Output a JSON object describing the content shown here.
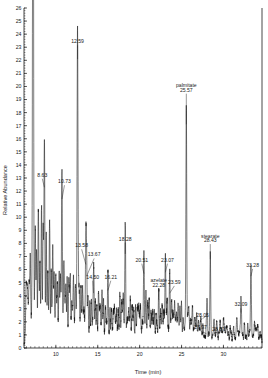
{
  "chart_data": {
    "type": "line",
    "title": "",
    "xlabel": "Time (min)",
    "ylabel": "Relative Abundance",
    "xlim": [
      6.2,
      34.6
    ],
    "ylim": [
      0,
      26
    ],
    "grid": false,
    "legend": "none",
    "x_ticks_major": [
      10,
      15,
      20,
      25,
      30
    ],
    "x_tick_labels": [
      "10",
      "15",
      "20",
      "25",
      "30"
    ],
    "x_minor_step": 0.5,
    "y_ticks_major": [
      0,
      1,
      2,
      3,
      4,
      5,
      6,
      7,
      8,
      9,
      10,
      11,
      12,
      13,
      14,
      15,
      16,
      17,
      18,
      19,
      20,
      21,
      22,
      23,
      24,
      25,
      26
    ],
    "y_tick_labels": [
      "0",
      "1",
      "2",
      "3",
      "4",
      "5",
      "6",
      "7",
      "8",
      "9",
      "10",
      "11",
      "12",
      "13",
      "14",
      "15",
      "16",
      "17",
      "18",
      "19",
      "20",
      "21",
      "22",
      "23",
      "24",
      "25",
      "26"
    ],
    "y_minor_step": 0.2,
    "trace_color": "#111111",
    "annotations": [
      {
        "rt": 8.63,
        "label": "8.63",
        "name": "",
        "height": 12.2,
        "label_y": 13.1,
        "label_x_shift": -0.25
      },
      {
        "rt": 10.73,
        "label": "10.73",
        "name": "",
        "height": 11.3,
        "label_y": 12.6,
        "label_x_shift": 0.3
      },
      {
        "rt": 12.59,
        "label": "12.59",
        "name": "",
        "height": 22.0,
        "label_y": 23.3,
        "label_x_shift": 0.0
      },
      {
        "rt": 13.58,
        "label": "13.58",
        "name": "",
        "height": 6.3,
        "label_y": 7.7,
        "label_x_shift": -0.5
      },
      {
        "rt": 13.67,
        "label": "13.67",
        "name": "",
        "height": 5.4,
        "label_y": 7.0,
        "label_x_shift": 0.9
      },
      {
        "rt": 14.5,
        "label": "14.50",
        "name": "",
        "height": 4.1,
        "label_y": 5.3,
        "label_x_shift": -0.1
      },
      {
        "rt": 16.21,
        "label": "16.21",
        "name": "",
        "height": 4.3,
        "label_y": 5.3,
        "label_x_shift": 0.35
      },
      {
        "rt": 18.28,
        "label": "18.28",
        "name": "",
        "height": 7.1,
        "label_y": 8.2,
        "label_x_shift": 0.0
      },
      {
        "rt": 20.51,
        "label": "20.51",
        "name": "",
        "height": 5.6,
        "label_y": 6.6,
        "label_x_shift": -0.25
      },
      {
        "rt": 22.28,
        "label": "22.28",
        "name": "azelate",
        "height": 3.6,
        "label_y": 4.7,
        "label_x_shift": 0.0
      },
      {
        "rt": 23.07,
        "label": "23.07",
        "name": "",
        "height": 5.7,
        "label_y": 6.6,
        "label_x_shift": 0.25
      },
      {
        "rt": 23.59,
        "label": "23.59",
        "name": "",
        "height": 4.1,
        "label_y": 4.9,
        "label_x_shift": 0.55
      },
      {
        "rt": 25.57,
        "label": "25.57",
        "name": "palmitate",
        "height": 17.0,
        "label_y": 19.6,
        "label_x_shift": 0.0
      },
      {
        "rt": 27.97,
        "label": "27.97",
        "name": "",
        "height": 1.0,
        "label_y": 1.45,
        "label_x_shift": -0.7
      },
      {
        "rt": 28.05,
        "label": "28.05",
        "name": "",
        "height": 2.4,
        "label_y": 2.4,
        "label_x_shift": -0.55
      },
      {
        "rt": 28.43,
        "label": "28.43",
        "name": "stearate",
        "height": 6.7,
        "label_y": 8.1,
        "label_x_shift": 0.0
      },
      {
        "rt": 28.87,
        "label": "28.87",
        "name": "",
        "height": 1.1,
        "label_y": 1.3,
        "label_x_shift": 0.55
      },
      {
        "rt": 32.09,
        "label": "32.09",
        "name": "",
        "height": 2.6,
        "label_y": 3.2,
        "label_x_shift": 0.0
      },
      {
        "rt": 33.28,
        "label": "33.28",
        "name": "",
        "height": 5.4,
        "label_y": 6.2,
        "label_x_shift": 0.2
      }
    ],
    "solvent_front": {
      "rt": 7.28,
      "height": 26.0,
      "note": "off-scale leading peak"
    },
    "series": [
      {
        "name": "TIC",
        "description": "Total ion chromatogram, relative abundance vs retention time",
        "major_peaks_rt": [
          7.28,
          8.63,
          10.73,
          12.59,
          13.58,
          13.67,
          14.5,
          16.21,
          18.28,
          20.51,
          22.28,
          23.07,
          23.59,
          25.57,
          27.97,
          28.05,
          28.43,
          28.87,
          32.09,
          33.28
        ],
        "major_peaks_height": [
          26.0,
          12.2,
          11.3,
          22.0,
          6.3,
          5.4,
          4.1,
          4.3,
          7.1,
          5.6,
          3.6,
          5.7,
          4.1,
          17.0,
          1.0,
          2.4,
          6.7,
          1.1,
          2.6,
          5.4
        ],
        "minor_peaks_rt": [
          6.45,
          6.62,
          6.8,
          6.95,
          7.55,
          7.72,
          7.9,
          8.1,
          8.3,
          8.48,
          8.85,
          9.05,
          9.25,
          9.45,
          9.62,
          9.8,
          10.0,
          10.2,
          10.4,
          10.55,
          10.95,
          11.15,
          11.35,
          11.55,
          11.72,
          11.9,
          12.1,
          12.3,
          12.8,
          13.0,
          13.2,
          13.35,
          13.85,
          14.05,
          14.25,
          14.7,
          14.9,
          15.1,
          15.3,
          15.5,
          15.7,
          15.9,
          16.45,
          16.65,
          16.85,
          17.05,
          17.25,
          17.45,
          17.65,
          17.85,
          18.05,
          18.5,
          18.7,
          18.9,
          19.1,
          19.3,
          19.5,
          19.7,
          19.9,
          20.1,
          20.3,
          20.75,
          20.95,
          21.15,
          21.35,
          21.55,
          21.75,
          21.95,
          22.5,
          22.7,
          22.9,
          23.3,
          23.8,
          24.0,
          24.2,
          24.4,
          24.6,
          24.8,
          25.0,
          25.2,
          25.85,
          26.05,
          26.3,
          26.55,
          26.8,
          27.05,
          27.3,
          27.55,
          29.2,
          29.6,
          30.0,
          30.4,
          30.8,
          31.2,
          31.6,
          32.5,
          32.9,
          33.7,
          34.1
        ],
        "minor_peaks_height": [
          2.1,
          3.4,
          2.6,
          4.2,
          5.6,
          4.4,
          6.1,
          4.9,
          7.4,
          5.2,
          6.8,
          4.3,
          5.5,
          3.8,
          4.6,
          3.2,
          4.0,
          2.8,
          3.5,
          2.4,
          3.9,
          2.7,
          3.3,
          2.2,
          2.9,
          2.0,
          2.6,
          1.9,
          2.3,
          1.8,
          2.5,
          1.7,
          2.1,
          1.6,
          1.9,
          2.2,
          1.5,
          1.8,
          1.4,
          1.7,
          1.3,
          1.6,
          2.0,
          1.4,
          1.7,
          1.3,
          1.9,
          1.4,
          1.6,
          1.3,
          1.8,
          1.5,
          1.3,
          1.7,
          1.4,
          1.9,
          1.3,
          1.6,
          1.4,
          1.8,
          1.3,
          1.7,
          1.4,
          2.0,
          1.5,
          1.3,
          1.8,
          1.4,
          1.6,
          1.3,
          1.5,
          1.4,
          1.6,
          1.3,
          1.8,
          1.4,
          1.3,
          1.6,
          1.4,
          1.3,
          1.5,
          1.2,
          1.4,
          1.1,
          1.3,
          1.0,
          1.2,
          1.1,
          0.9,
          0.8,
          0.9,
          0.7,
          0.8,
          0.7,
          0.9,
          1.0,
          0.8,
          0.9,
          0.7
        ],
        "baseline": 0.35,
        "noise_amplitude": 0.55
      }
    ]
  }
}
